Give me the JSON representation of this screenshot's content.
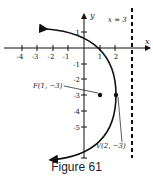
{
  "figure": {
    "caption": "Figure 61",
    "axes": {
      "x_label": "x",
      "y_label": "y",
      "x_ticks": [
        "-4",
        "-3",
        "-2",
        "-1",
        "1",
        "2"
      ],
      "y_ticks": [
        "1",
        "-1",
        "-2",
        "-3",
        "-4",
        "-5"
      ]
    },
    "directrix_label": "x = 3",
    "focus_label": "F(1, −3)",
    "vertex_label": "V(2, −3)",
    "curve": "parabola (y+3)^2 = -4(x-2)",
    "colors": {
      "ink": "#111111",
      "background": "#ffffff"
    }
  }
}
